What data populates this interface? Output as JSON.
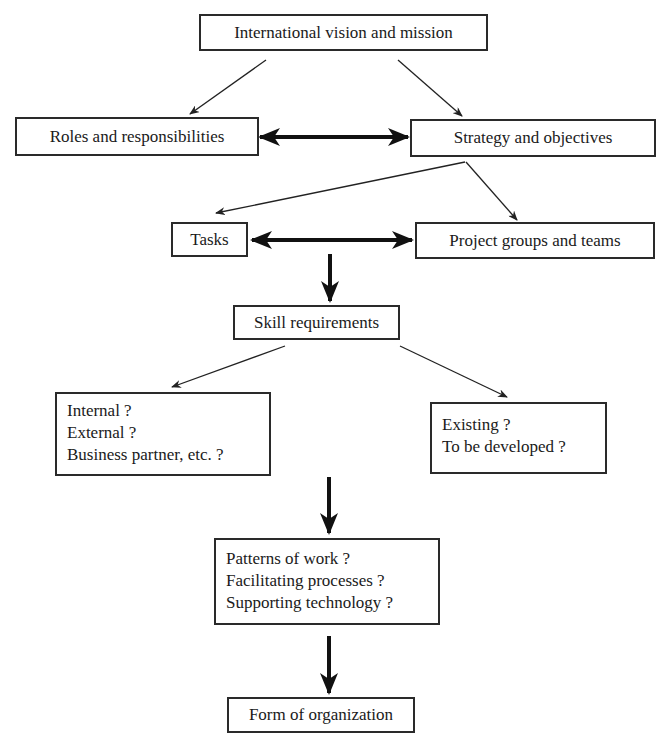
{
  "diagram": {
    "nodes": {
      "vision": {
        "label": "International vision and mission"
      },
      "roles": {
        "label": "Roles and responsibilities"
      },
      "strategy": {
        "label": "Strategy and objectives"
      },
      "tasks": {
        "label": "Tasks"
      },
      "project_groups": {
        "label": "Project groups and teams"
      },
      "skills": {
        "label": "Skill requirements"
      },
      "sourcing": {
        "lines": [
          "Internal ?",
          "External ?",
          "Business partner, etc. ?"
        ]
      },
      "development": {
        "lines": [
          "Existing ?",
          "To be developed ?"
        ]
      },
      "work": {
        "lines": [
          "Patterns of work ?",
          "Facilitating processes ?",
          "Supporting technology ?"
        ]
      },
      "form": {
        "label": "Form of organization"
      }
    },
    "edges": [
      {
        "from": "vision",
        "to": "roles",
        "style": "thin"
      },
      {
        "from": "vision",
        "to": "strategy",
        "style": "thin"
      },
      {
        "from": "roles",
        "to": "strategy",
        "style": "bold-bidirectional"
      },
      {
        "from": "strategy",
        "to": "tasks",
        "style": "thin"
      },
      {
        "from": "strategy",
        "to": "project_groups",
        "style": "thin"
      },
      {
        "from": "tasks",
        "to": "project_groups",
        "style": "bold-bidirectional"
      },
      {
        "from": "tasks",
        "to": "skills",
        "style": "bold"
      },
      {
        "from": "skills",
        "to": "sourcing",
        "style": "thin"
      },
      {
        "from": "skills",
        "to": "development",
        "style": "thin"
      },
      {
        "from": "sourcing",
        "to": "work",
        "style": "bold"
      },
      {
        "from": "work",
        "to": "form",
        "style": "bold"
      }
    ]
  }
}
